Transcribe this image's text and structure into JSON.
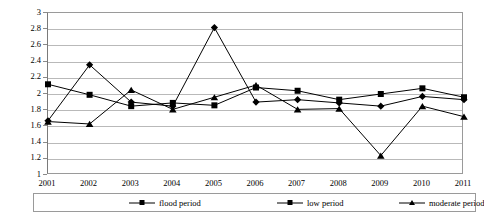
{
  "chart_data": {
    "type": "line",
    "title": "",
    "xlabel": "",
    "ylabel": "",
    "categories": [
      "2001",
      "2002",
      "2003",
      "2004",
      "2005",
      "2006",
      "2007",
      "2008",
      "2009",
      "2010",
      "2011"
    ],
    "ylim": [
      1,
      3
    ],
    "ytick_step": 0.2,
    "yticks": [
      "3",
      "2.8",
      "2.6",
      "2.4",
      "2.2",
      "2",
      "1.8",
      "1.6",
      "1.4",
      "1.2",
      "1"
    ],
    "grid": true,
    "legend_position": "bottom",
    "series": [
      {
        "name": "flood period",
        "marker": "diamond",
        "values": [
          1.67,
          2.36,
          1.9,
          1.85,
          2.82,
          1.9,
          1.93,
          1.89,
          1.85,
          1.97,
          1.93
        ]
      },
      {
        "name": "low period",
        "marker": "square",
        "values": [
          2.12,
          1.99,
          1.85,
          1.89,
          1.86,
          2.08,
          2.04,
          1.93,
          2.0,
          2.07,
          1.96
        ]
      },
      {
        "name": "moderate period",
        "marker": "triangle",
        "values": [
          1.66,
          1.63,
          2.05,
          1.81,
          1.96,
          2.11,
          1.81,
          1.82,
          1.24,
          1.85,
          1.72
        ]
      }
    ]
  },
  "axis": {
    "y_labels": [
      "3",
      "2.8",
      "2.6",
      "2.4",
      "2.2",
      "2",
      "1.8",
      "1.6",
      "1.4",
      "1.2",
      "1"
    ],
    "x_labels": [
      "2001",
      "2002",
      "2003",
      "2004",
      "2005",
      "2006",
      "2007",
      "2008",
      "2009",
      "2010",
      "2011"
    ]
  },
  "legend": {
    "items": [
      {
        "label": "flood period",
        "marker": "diamond"
      },
      {
        "label": "low period",
        "marker": "square"
      },
      {
        "label": "moderate period",
        "marker": "triangle"
      }
    ]
  },
  "colors": {
    "series_color": "#000000",
    "gridline": "#b9b9b9",
    "axis": "#8a8a8a",
    "background": "#ffffff"
  }
}
